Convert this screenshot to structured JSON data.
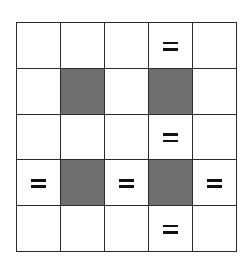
{
  "page": {
    "background_color": "#ffffff"
  },
  "grid": {
    "rows": 5,
    "columns": 5,
    "cell_width_px": 43,
    "cell_height_px": 45,
    "border_color": "#2b2b2b",
    "border_width_px": 2,
    "empty_cell_color": "#ffffff",
    "shaded_cell_color": "#6f6f6f",
    "mark_color": "#111111",
    "mark_icon_name": "equals-icon",
    "mark_symbol": "=",
    "cells": [
      [
        {
          "state": "empty",
          "mark": ""
        },
        {
          "state": "empty",
          "mark": ""
        },
        {
          "state": "empty",
          "mark": ""
        },
        {
          "state": "empty",
          "mark": "="
        },
        {
          "state": "empty",
          "mark": ""
        }
      ],
      [
        {
          "state": "empty",
          "mark": ""
        },
        {
          "state": "shaded",
          "mark": ""
        },
        {
          "state": "empty",
          "mark": ""
        },
        {
          "state": "shaded",
          "mark": ""
        },
        {
          "state": "empty",
          "mark": ""
        }
      ],
      [
        {
          "state": "empty",
          "mark": ""
        },
        {
          "state": "empty",
          "mark": ""
        },
        {
          "state": "empty",
          "mark": ""
        },
        {
          "state": "empty",
          "mark": "="
        },
        {
          "state": "empty",
          "mark": ""
        }
      ],
      [
        {
          "state": "empty",
          "mark": "="
        },
        {
          "state": "shaded",
          "mark": ""
        },
        {
          "state": "empty",
          "mark": "="
        },
        {
          "state": "shaded",
          "mark": ""
        },
        {
          "state": "empty",
          "mark": "="
        }
      ],
      [
        {
          "state": "empty",
          "mark": ""
        },
        {
          "state": "empty",
          "mark": ""
        },
        {
          "state": "empty",
          "mark": ""
        },
        {
          "state": "empty",
          "mark": "="
        },
        {
          "state": "empty",
          "mark": ""
        }
      ]
    ],
    "shaded_positions": [
      {
        "row": 2,
        "column": 2
      },
      {
        "row": 2,
        "column": 4
      },
      {
        "row": 4,
        "column": 2
      },
      {
        "row": 4,
        "column": 4
      }
    ],
    "marked_positions": [
      {
        "row": 1,
        "column": 4
      },
      {
        "row": 3,
        "column": 4
      },
      {
        "row": 4,
        "column": 1
      },
      {
        "row": 4,
        "column": 3
      },
      {
        "row": 4,
        "column": 5
      },
      {
        "row": 5,
        "column": 4
      }
    ]
  }
}
